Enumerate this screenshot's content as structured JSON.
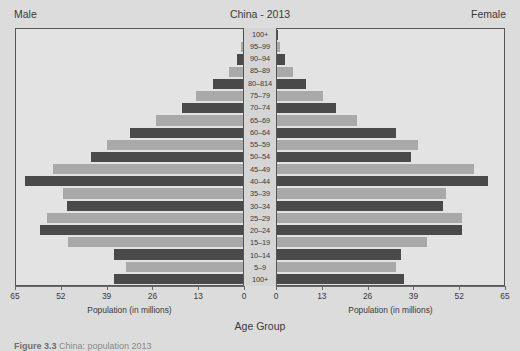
{
  "header": {
    "male_label": "Male",
    "female_label": "Female",
    "title": "China - 2013"
  },
  "axis": {
    "left_title": "Population (in millions)",
    "right_title": "Population (in millions)",
    "group_title": "Age Group",
    "left_ticks": [
      "65",
      "52",
      "39",
      "26",
      "13",
      "0"
    ],
    "right_ticks": [
      "0",
      "13",
      "26",
      "39",
      "52",
      "65"
    ]
  },
  "caption": {
    "figure_number": "Figure 3.3",
    "text": "China: population 2013"
  },
  "colors": {
    "bar_dark": "#4a4a4a",
    "bar_light": "#a9a9a9",
    "panel_bg": "#e3e3e3",
    "page_bg": "#dcdcdc",
    "axis": "#6a6a6a",
    "center_band": "#d5d5d5"
  },
  "chart_data": {
    "type": "bar",
    "title": "China - 2013",
    "subtitle": "",
    "xlabel": "Population (in millions)",
    "ylabel": "Age Group",
    "xlim": [
      0,
      65
    ],
    "grid": false,
    "legend": [
      "Male",
      "Female"
    ],
    "legend_position": "top-corners",
    "orientation": "population-pyramid",
    "categories": [
      "100+",
      "95–99",
      "90–94",
      "85–89",
      "80–814",
      "75–79",
      "70–74",
      "65–69",
      "60–64",
      "55–59",
      "50–54",
      "45–49",
      "40–44",
      "35–39",
      "30–34",
      "25–29",
      "20–24",
      "15–19",
      "10–14",
      "5–9",
      "100+"
    ],
    "series": [
      {
        "name": "Male",
        "side": "left",
        "values": [
          0.1,
          0.6,
          1.7,
          4.0,
          8.5,
          13.4,
          17.5,
          25.0,
          32.5,
          39.0,
          43.5,
          54.5,
          62.5,
          51.5,
          50.5,
          56.0,
          58.0,
          50.0,
          37.0,
          33.5,
          37.0
        ]
      },
      {
        "name": "Female",
        "side": "right",
        "values": [
          0.2,
          0.8,
          2.2,
          4.6,
          8.4,
          13.3,
          16.8,
          23.0,
          34.0,
          40.5,
          38.5,
          56.5,
          60.5,
          48.5,
          47.5,
          53.0,
          53.0,
          43.0,
          35.5,
          34.0,
          36.5
        ]
      }
    ],
    "bar_color_cycle": [
      "#4a4a4a",
      "#a9a9a9"
    ]
  }
}
